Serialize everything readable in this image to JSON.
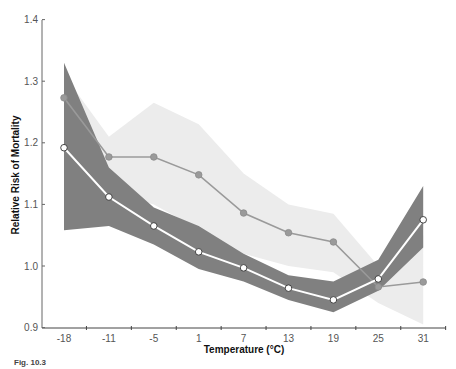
{
  "chart_data": {
    "type": "line",
    "title": "",
    "xlabel": "Temperature (°C)",
    "ylabel": "Relative Risk of Mortality",
    "categories": [
      "-18",
      "-11",
      "-5",
      "1",
      "7",
      "13",
      "19",
      "25",
      "31"
    ],
    "ylim": [
      0.9,
      1.4
    ],
    "yticks": [
      "0.9",
      "1.0",
      "1.1",
      "1.2",
      "1.3",
      "1.4"
    ],
    "grid": false,
    "legend": null,
    "series": [
      {
        "name": "gray-marker-series",
        "marker": "filled gray circle",
        "values": [
          1.273,
          1.177,
          1.177,
          1.148,
          1.086,
          1.054,
          1.039,
          0.966,
          0.974
        ],
        "ci_lower": [
          1.2,
          1.12,
          1.1,
          1.06,
          1.02,
          1.0,
          0.99,
          0.94,
          0.905
        ],
        "ci_upper": [
          1.31,
          1.21,
          1.265,
          1.23,
          1.15,
          1.1,
          1.085,
          1.0,
          1.05
        ]
      },
      {
        "name": "white-marker-series",
        "marker": "open white circle",
        "values": [
          1.192,
          1.112,
          1.065,
          1.023,
          0.997,
          0.964,
          0.945,
          0.979,
          1.075
        ],
        "ci_lower": [
          1.058,
          1.065,
          1.035,
          0.995,
          0.975,
          0.945,
          0.925,
          0.96,
          1.03
        ],
        "ci_upper": [
          1.33,
          1.16,
          1.095,
          1.065,
          1.02,
          0.985,
          0.975,
          1.01,
          1.13
        ]
      }
    ]
  },
  "caption": {
    "text": "Fig. 10.3"
  },
  "colors": {
    "light_band": "#ececec",
    "dark_band": "#808080",
    "gray_line": "#9a9a9a",
    "white_line": "#ffffff",
    "axis": "#555555"
  }
}
